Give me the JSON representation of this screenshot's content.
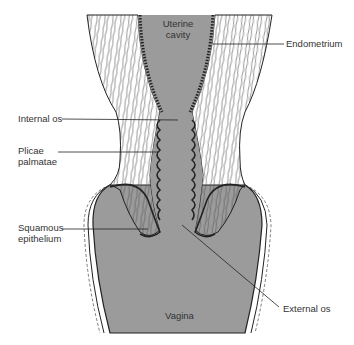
{
  "figure": {
    "colors": {
      "tissue_gray": "#9b9b9b",
      "outline": "#222222",
      "background": "#ffffff"
    }
  },
  "labels": {
    "uterine_cavity": [
      "Uterine",
      "cavity"
    ],
    "endometrium": "Endometrium",
    "internal_os": "Internal os",
    "plicae_palmatae": [
      "Plicae",
      "palmatae"
    ],
    "squamous_epithelium": [
      "Squamous",
      "epithelium"
    ],
    "external_os": "External os",
    "vagina": "Vagina"
  }
}
